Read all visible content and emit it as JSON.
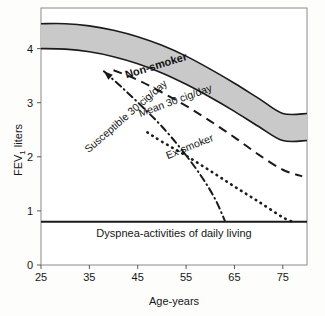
{
  "chart_data": {
    "type": "line",
    "title": "",
    "subtitle": "",
    "xlabel": "Age-years",
    "ylabel": "FEV1 liters",
    "ylabel_main": "FEV",
    "ylabel_sub": "1",
    "ylabel_unit": " liters",
    "xlim": [
      25,
      80
    ],
    "ylim": [
      0,
      4.75
    ],
    "xticks": [
      25,
      35,
      45,
      55,
      65,
      75
    ],
    "yticks": [
      0,
      1,
      2,
      3,
      4
    ],
    "xtick_labels": [
      "25",
      "35",
      "45",
      "55",
      "65",
      "75"
    ],
    "ytick_labels": [
      "0",
      "1",
      "2",
      "3",
      "4"
    ],
    "grid": false,
    "legend_position": "inline-labels",
    "band": {
      "name": "Non-smoker",
      "label": "Non-smoker",
      "fill_color": "#c9c9c9",
      "edge_color": "#1a1a1a",
      "upper": [
        {
          "age": 25,
          "fev1": 4.46
        },
        {
          "age": 30,
          "fev1": 4.46
        },
        {
          "age": 35,
          "fev1": 4.42
        },
        {
          "age": 40,
          "fev1": 4.34
        },
        {
          "age": 45,
          "fev1": 4.22
        },
        {
          "age": 50,
          "fev1": 4.06
        },
        {
          "age": 55,
          "fev1": 3.86
        },
        {
          "age": 60,
          "fev1": 3.62
        },
        {
          "age": 65,
          "fev1": 3.36
        },
        {
          "age": 70,
          "fev1": 3.08
        },
        {
          "age": 75,
          "fev1": 2.8
        },
        {
          "age": 80,
          "fev1": 2.8
        }
      ],
      "lower": [
        {
          "age": 25,
          "fev1": 4.0
        },
        {
          "age": 30,
          "fev1": 3.99
        },
        {
          "age": 35,
          "fev1": 3.94
        },
        {
          "age": 40,
          "fev1": 3.85
        },
        {
          "age": 45,
          "fev1": 3.72
        },
        {
          "age": 50,
          "fev1": 3.55
        },
        {
          "age": 55,
          "fev1": 3.34
        },
        {
          "age": 60,
          "fev1": 3.1
        },
        {
          "age": 65,
          "fev1": 2.84
        },
        {
          "age": 70,
          "fev1": 2.56
        },
        {
          "age": 75,
          "fev1": 2.3
        },
        {
          "age": 80,
          "fev1": 2.3
        }
      ]
    },
    "series": [
      {
        "name": "Mean 30 cig/day",
        "label": "Mean 30 cig/day",
        "style": "dashed",
        "color": "#1a1a1a",
        "points": [
          {
            "age": 40,
            "fev1": 3.6
          },
          {
            "age": 45,
            "fev1": 3.42
          },
          {
            "age": 50,
            "fev1": 3.19
          },
          {
            "age": 55,
            "fev1": 2.94
          },
          {
            "age": 60,
            "fev1": 2.66
          },
          {
            "age": 65,
            "fev1": 2.36
          },
          {
            "age": 70,
            "fev1": 2.04
          },
          {
            "age": 75,
            "fev1": 1.76
          },
          {
            "age": 79,
            "fev1": 1.64
          }
        ]
      },
      {
        "name": "Ex-smoker",
        "label": "Ex-smoker",
        "style": "dotted",
        "color": "#1a1a1a",
        "points": [
          {
            "age": 47,
            "fev1": 2.45
          },
          {
            "age": 50,
            "fev1": 2.28
          },
          {
            "age": 55,
            "fev1": 2.02
          },
          {
            "age": 60,
            "fev1": 1.74
          },
          {
            "age": 65,
            "fev1": 1.45
          },
          {
            "age": 70,
            "fev1": 1.17
          },
          {
            "age": 75,
            "fev1": 0.88
          },
          {
            "age": 77,
            "fev1": 0.8
          }
        ]
      },
      {
        "name": "Susceptible 30 cig/day",
        "label": "Susceptible 30 cig/day",
        "style": "dash-dot",
        "color": "#1a1a1a",
        "points": [
          {
            "age": 38,
            "fev1": 3.58
          },
          {
            "age": 42,
            "fev1": 3.26
          },
          {
            "age": 46,
            "fev1": 2.92
          },
          {
            "age": 50,
            "fev1": 2.56
          },
          {
            "age": 54,
            "fev1": 2.14
          },
          {
            "age": 58,
            "fev1": 1.66
          },
          {
            "age": 61,
            "fev1": 1.22
          },
          {
            "age": 63,
            "fev1": 0.82
          }
        ],
        "has_arrow": true,
        "arrow_tip": {
          "age": 38,
          "fev1": 3.58
        }
      }
    ],
    "threshold": {
      "label": "Dyspnea-activities of daily living",
      "value": 0.8,
      "color": "#1a1a1a"
    },
    "annotations": [
      {
        "name": "band-label",
        "text": "Non-smoker",
        "age": 49,
        "fev1": 3.62,
        "rotation": -17,
        "bold": true
      },
      {
        "name": "mean-label",
        "text": "Mean 30 cig/day",
        "age": 53,
        "fev1": 2.98,
        "rotation": -20,
        "bold": false
      },
      {
        "name": "exsmoker-label",
        "text": "Ex-smoker",
        "age": 56,
        "fev1": 2.13,
        "rotation": -22,
        "bold": false
      },
      {
        "name": "susceptible-label",
        "text": "Susceptible 30 cig/day",
        "age": 43,
        "fev1": 2.7,
        "rotation": -41,
        "bold": false
      }
    ]
  }
}
